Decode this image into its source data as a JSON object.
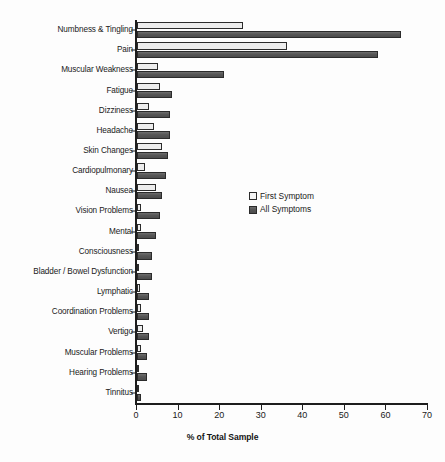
{
  "chart_data": {
    "type": "bar",
    "orientation": "horizontal",
    "title": "",
    "xlabel": "% of Total Sample",
    "ylabel": "",
    "xlim": [
      0,
      70
    ],
    "xticks": [
      0,
      10,
      20,
      30,
      40,
      50,
      60,
      70
    ],
    "grid": false,
    "legend_position": "center-right",
    "categories": [
      "Numbness & Tingling",
      "Pain",
      "Muscular Weakness",
      "Fatigue",
      "Dizziness",
      "Headache",
      "Skin Changes",
      "Cardiopulmonary",
      "Nausea",
      "Vision Problems",
      "Mental",
      "Consciousness",
      "Bladder / Bowel Dysfunction",
      "Lymphatic",
      "Coordination Problems",
      "Vertigo",
      "Muscular Problems",
      "Hearing Problems",
      "Tinnitus"
    ],
    "series": [
      {
        "name": "First Symptom",
        "color": "#ededed",
        "values": [
          25.5,
          36.0,
          5.0,
          5.5,
          3.0,
          4.0,
          6.0,
          2.0,
          4.5,
          1.0,
          1.0,
          0.5,
          0.2,
          0.8,
          1.0,
          1.5,
          1.0,
          0.5,
          0.3
        ]
      },
      {
        "name": "All Symptoms",
        "color": "#5c5c5c",
        "values": [
          63.5,
          58.0,
          21.0,
          8.5,
          8.0,
          8.0,
          7.5,
          7.0,
          6.0,
          5.5,
          4.5,
          3.5,
          3.5,
          3.0,
          3.0,
          3.0,
          2.5,
          2.5,
          1.0
        ]
      }
    ]
  },
  "legend": {
    "items": [
      {
        "label": "First Symptom",
        "swatch": "first-symptom-swatch"
      },
      {
        "label": "All Symptoms",
        "swatch": "all-symptoms-swatch"
      }
    ]
  },
  "axis": {
    "x_title": "% of Total Sample",
    "x_tick_labels": [
      "0",
      "10",
      "20",
      "30",
      "40",
      "50",
      "60",
      "70"
    ]
  }
}
